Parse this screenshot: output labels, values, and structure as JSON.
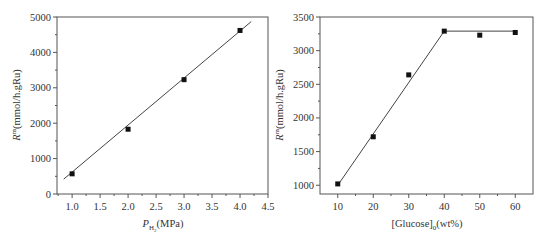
{
  "chart_data": [
    {
      "type": "scatter",
      "title": "",
      "xlabel": "P_H2(MPa)",
      "xlabel_main": "P",
      "xlabel_sub": "H",
      "xlabel_subsub": "2",
      "xlabel_unit": "(MPa)",
      "ylabel": "R^m(mmol/h.gRu)",
      "ylabel_main": "R",
      "ylabel_sup": "m",
      "ylabel_unit": "(mmol/h.gRu)",
      "xlim": [
        0.73,
        4.5
      ],
      "ylim": [
        0,
        5000
      ],
      "xticks": [
        "1.0",
        "1.5",
        "2.0",
        "2.5",
        "3.0",
        "3.5",
        "4.0",
        "4.5"
      ],
      "yticks": [
        "0",
        "1000",
        "2000",
        "3000",
        "4000",
        "5000"
      ],
      "x": [
        1.0,
        2.0,
        3.0,
        4.0
      ],
      "values": [
        570,
        1830,
        3230,
        4620
      ],
      "fit_line": {
        "x": [
          0.85,
          4.2
        ],
        "y": [
          420,
          4870
        ]
      },
      "grid": false,
      "legend": null
    },
    {
      "type": "scatter",
      "title": "",
      "xlabel": "[Glucose]_0(wt%)",
      "xlabel_main": "[Glucose]",
      "xlabel_sub": "0",
      "xlabel_unit": "(wt%)",
      "ylabel": "R^m(mmol/h.gRu)",
      "ylabel_main": "R",
      "ylabel_sup": "m",
      "ylabel_unit": "(mmol/h.gRu)",
      "xlim": [
        5,
        65
      ],
      "ylim": [
        870,
        3500
      ],
      "xticks": [
        "10",
        "20",
        "30",
        "40",
        "50",
        "60"
      ],
      "yticks": [
        "1000",
        "1500",
        "2000",
        "2500",
        "3000",
        "3500"
      ],
      "x": [
        10,
        20,
        30,
        40,
        50,
        60
      ],
      "values": [
        1020,
        1720,
        2640,
        3290,
        3230,
        3270
      ],
      "fit_line": {
        "x": [
          10,
          40,
          60
        ],
        "y": [
          1000,
          3290,
          3290
        ]
      },
      "grid": false,
      "legend": null
    }
  ]
}
